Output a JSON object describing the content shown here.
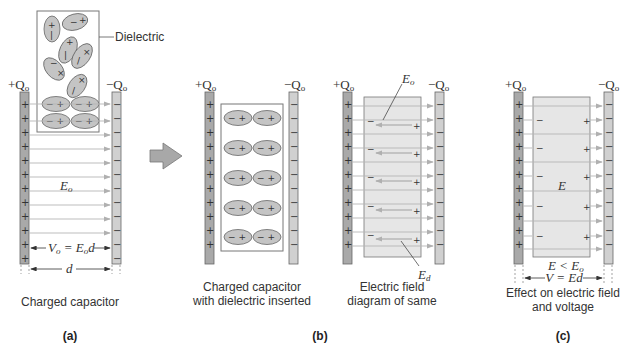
{
  "figure": {
    "panels": [
      {
        "id": "a",
        "label": "(a)",
        "caption": "Charged capacitor",
        "left_plate_charge": "+Q",
        "left_plate_sub": "o",
        "right_plate_charge": "−Q",
        "right_plate_sub": "o",
        "field_label": "E",
        "field_sub": "o",
        "voltage_eq_V": "V",
        "voltage_eq_sub": "o",
        "voltage_eq_rest": " = E",
        "voltage_eq_rest_sub": "o",
        "voltage_eq_d": "d",
        "distance_label": "d",
        "dielectric_callout": "Dielectric"
      },
      {
        "id": "b",
        "label": "(b)",
        "sub_captions": [
          {
            "line1": "Charged capacitor",
            "line2": "with dielectric inserted"
          },
          {
            "line1": "Electric field",
            "line2": "diagram of same"
          }
        ],
        "left_plate_charge": "+Q",
        "right_plate_charge": "−Q",
        "plate_sub": "o",
        "field_label_top": "E",
        "field_label_top_sub": "o",
        "field_label_bottom": "E",
        "field_label_bottom_sub": "d"
      },
      {
        "id": "c",
        "label": "(c)",
        "caption_line1": "Effect on electric field",
        "caption_line2": "and voltage",
        "left_plate_charge": "+Q",
        "right_plate_charge": "−Q",
        "plate_sub": "o",
        "field_label": "E",
        "inequality": "E < E",
        "inequality_sub": "o",
        "voltage_eq": "V = Ed"
      }
    ],
    "signs": {
      "plus": "+",
      "minus": "−"
    },
    "colors": {
      "plate_positive": "#a9a9a9",
      "plate_negative": "#d0d0d0",
      "dielectric_fill": "#e6e6e6",
      "molecule_fill": "#c4c4c4",
      "field_line": "#b5b5b5",
      "arrow_fill": "#b0b0b0"
    }
  }
}
